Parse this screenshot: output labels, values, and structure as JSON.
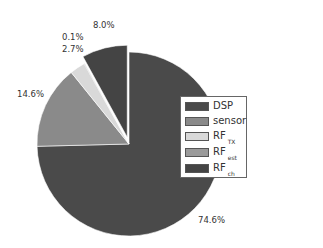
{
  "chart_data": {
    "type": "pie",
    "title": "",
    "categories": [
      "DSP",
      "sensor",
      "RF_TX",
      "RF_est",
      "RF_ch"
    ],
    "values": [
      74.6,
      14.6,
      2.7,
      0.1,
      8.0
    ],
    "labels": [
      "74.6%",
      "14.6%",
      "2.7%",
      "0.1%",
      "8.0%"
    ],
    "colors": [
      "#4a4a4a",
      "#8a8a8a",
      "#d9d9d9",
      "#9a9a9a",
      "#444444"
    ],
    "exploded": [
      false,
      false,
      false,
      false,
      true
    ],
    "legend_position": "right-inside",
    "start_angle_deg": 0,
    "direction": "clockwise"
  },
  "legend": {
    "items": [
      {
        "label": "DSP",
        "sub": ""
      },
      {
        "label": "sensor",
        "sub": ""
      },
      {
        "label": "RF",
        "sub": "TX"
      },
      {
        "label": "RF",
        "sub": "est"
      },
      {
        "label": "RF",
        "sub": "ch"
      }
    ]
  },
  "slice_labels": {
    "dsp": "74.6%",
    "sensor": "14.6%",
    "rf_tx": "2.7%",
    "rf_est": "0.1%",
    "rf_ch": "8.0%"
  }
}
